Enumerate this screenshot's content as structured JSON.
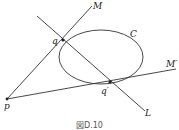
{
  "figure": {
    "caption": "図D.10",
    "labels": {
      "M": "M",
      "C": "C",
      "q": "q",
      "M_prime": "M′",
      "q_prime": "q′",
      "p": "p",
      "L": "L"
    },
    "colors": {
      "stroke": "#333333",
      "background": "#ffffff"
    }
  }
}
